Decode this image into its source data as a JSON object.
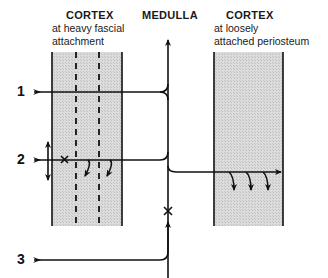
{
  "diagram": {
    "columns": {
      "left_cortex": {
        "title": "CORTEX",
        "subtitle_line1": "at heavy fascial",
        "subtitle_line2": "attachment"
      },
      "medulla": {
        "title": "MEDULLA"
      },
      "right_cortex": {
        "title": "CORTEX",
        "subtitle_line1": "at loosely",
        "subtitle_line2": "attached periosteum"
      }
    },
    "paths": [
      {
        "label": "1"
      },
      {
        "label": "2"
      },
      {
        "label": "3"
      }
    ],
    "colors": {
      "cortex_fill": "#d6d6d6",
      "line": "#111111"
    }
  }
}
